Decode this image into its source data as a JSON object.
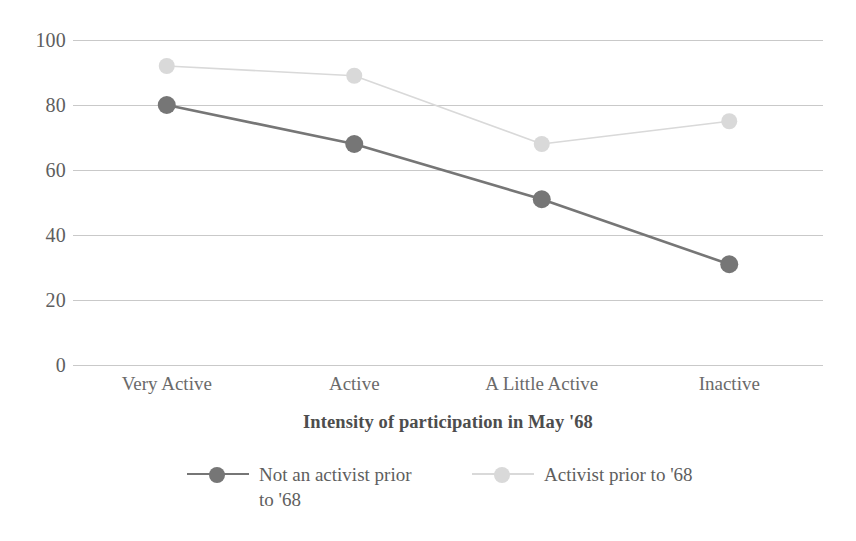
{
  "chart_data": {
    "type": "line",
    "title": "",
    "xlabel": "Intensity of participation in May '68",
    "ylabel": "",
    "categories": [
      "Very Active",
      "Active",
      "A Little Active",
      "Inactive"
    ],
    "series": [
      {
        "name": "Not an activist prior to '68",
        "values": [
          80,
          68,
          51,
          31
        ],
        "color": "#767676",
        "marker": "circle"
      },
      {
        "name": "Activist prior to '68",
        "values": [
          92,
          89,
          68,
          75
        ],
        "color": "#d9d9d9",
        "marker": "circle"
      }
    ],
    "yticks": [
      100,
      80,
      60,
      40,
      20,
      0
    ],
    "ylim": [
      0,
      100
    ],
    "grid": "horizontal",
    "legend_position": "bottom"
  },
  "axis": {
    "y_tick_labels": [
      "100",
      "80",
      "60",
      "40",
      "20",
      "0"
    ],
    "x_tick_labels": [
      "Very Active",
      "Active",
      "A Little Active",
      "Inactive"
    ],
    "x_title": "Intensity of participation in May '68"
  },
  "legend": {
    "items": [
      {
        "label": "Not an activist prior to '68",
        "color": "#767676"
      },
      {
        "label": "Activist prior to '68",
        "color": "#d9d9d9"
      }
    ]
  },
  "colors": {
    "grid": "#c9c9c9",
    "text": "#5e5e5e",
    "series_dark": "#767676",
    "series_light": "#d9d9d9",
    "background": "#ffffff"
  }
}
